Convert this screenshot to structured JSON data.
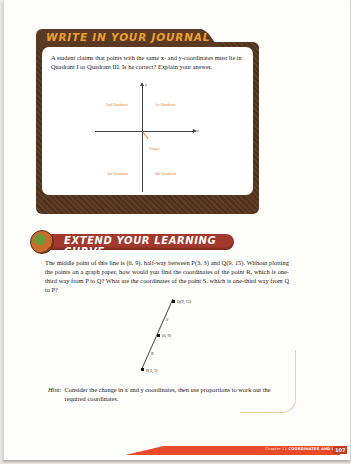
{
  "journal": {
    "title": "WRITE IN YOUR JOURNAL",
    "prompt": "A student claims that points with the same x- and y-coordinates must lie in Quadrant I or Quadrant III. Is he correct? Explain your answer.",
    "diagram": {
      "quadrants": {
        "q2": "2nd Quadrant",
        "q1": "1st Quadrant",
        "q3": "3rd Quadrant",
        "q4": "4th Quadrant"
      },
      "origin_label": "Origin",
      "x_axis_label": "x",
      "y_axis_label": "y"
    }
  },
  "extend": {
    "title": "EXTEND YOUR LEARNING CURVE",
    "prompt": "The middle point of this line is (6, 9), half-way between P(3, 3) and Q(9, 15). Without plotting the points on a graph paper, how would you find the coordinates of the point R, which is one-third way from P to Q? What are the coordinates of the point S, which is one-third way from Q to P?",
    "diagram": {
      "points": [
        {
          "label": "Q(9, 15)"
        },
        {
          "label": "(6, 9)"
        },
        {
          "label": "P(3, 3)"
        }
      ],
      "segment_labels": [
        "S",
        "R"
      ]
    },
    "hint_key": "Hint:",
    "hint_text": "Consider the change in x and y coordinates, then use proportions to work out the required coordinates."
  },
  "footer": {
    "chapter": "Chapter 11",
    "section": "COORDINATES AND GRAPHS",
    "page_number": "107",
    "accent": "#e84a2a"
  }
}
